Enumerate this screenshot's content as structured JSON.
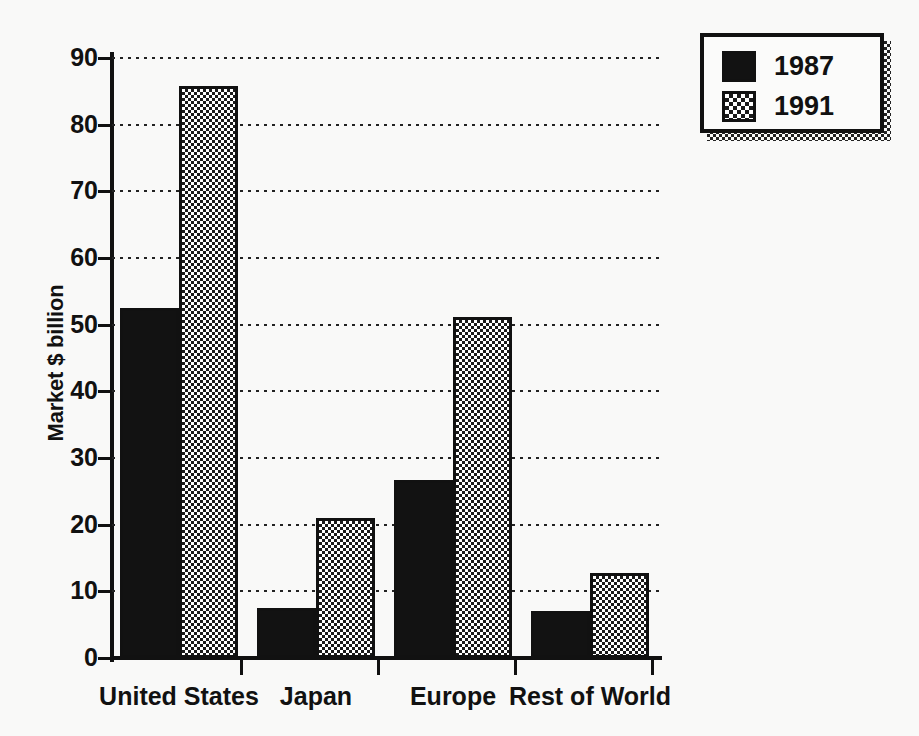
{
  "chart_data": {
    "type": "bar",
    "title": "",
    "xlabel": "",
    "ylabel": "Market $ billion",
    "categories": [
      "United States",
      "Japan",
      "Europe",
      "Rest of World"
    ],
    "series": [
      {
        "name": "1987",
        "values": [
          52.5,
          7.5,
          26.7,
          7.0
        ],
        "fill": "solid-black",
        "color": "#121212"
      },
      {
        "name": "1991",
        "values": [
          85.8,
          21.0,
          51.2,
          12.7
        ],
        "fill": "checkerboard",
        "color": "#1a1a1a"
      }
    ],
    "ylim": [
      0,
      90
    ],
    "yticks": [
      0,
      10,
      20,
      30,
      40,
      50,
      60,
      70,
      80,
      90
    ],
    "ytick_labels": [
      "0",
      "10",
      "20",
      "30",
      "40",
      "50",
      "60",
      "70",
      "80",
      "90"
    ],
    "grid": true,
    "grid_style": "dotted-horizontal",
    "legend": {
      "position": "top-right",
      "entries": [
        {
          "label": "1987",
          "swatch": "solid-black"
        },
        {
          "label": "1991",
          "swatch": "checkerboard"
        }
      ]
    }
  },
  "colors": {
    "background": "#f9f9f8",
    "axis": "#111111",
    "text": "#111111",
    "series_1987": "#121212",
    "series_1991": "#1a1a1a"
  }
}
